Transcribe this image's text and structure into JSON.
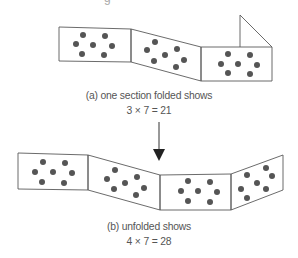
{
  "diagram": {
    "clipped_top_text": "g",
    "top_strip": {
      "caption_line1": "(a) one section folded shows",
      "caption_line2": "3 × 7 = 21",
      "visible_sections": 3,
      "dots_per_section": 7,
      "folded_section": "right end, flap folded up"
    },
    "bottom_strip": {
      "caption_line1": "(b) unfolded shows",
      "caption_line2": "4 × 7 = 28",
      "visible_sections": 4,
      "dots_per_section": 7
    },
    "arrow": {
      "direction": "down",
      "from": "top_strip",
      "to": "bottom_strip"
    },
    "colors": {
      "outline": "#555555",
      "dot": "#555555",
      "text": "#555555",
      "background": "#ffffff"
    }
  }
}
